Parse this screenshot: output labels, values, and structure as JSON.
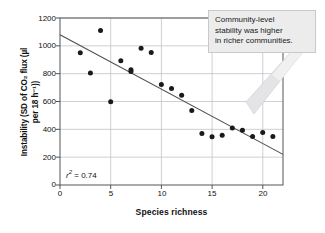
{
  "chart_data": {
    "type": "scatter",
    "title": "",
    "xlabel": "Species richness",
    "ylabel": "Instability (SD of CO2 flux (µl per 18 h−1))",
    "ylabel_line1": "Instability (SD of CO₂ flux (µl",
    "ylabel_line2": "per 18 h⁻¹))",
    "xlim": [
      0,
      22
    ],
    "ylim": [
      0,
      1200
    ],
    "xticks": [
      0,
      5,
      10,
      15,
      20
    ],
    "yticks": [
      0,
      200,
      400,
      600,
      800,
      1000,
      1200
    ],
    "xtick_labels": [
      "0",
      "5",
      "10",
      "15",
      "20"
    ],
    "ytick_labels": [
      "0",
      "200",
      "400",
      "600",
      "800",
      "1000",
      "1200"
    ],
    "grid": true,
    "legend": "none",
    "x": [
      2,
      3,
      4,
      5,
      6,
      7,
      7,
      8,
      9,
      10,
      11,
      12,
      13,
      14,
      15,
      16,
      17,
      18,
      19,
      20,
      21
    ],
    "y": [
      950,
      805,
      1110,
      598,
      893,
      828,
      816,
      983,
      952,
      723,
      694,
      645,
      536,
      370,
      346,
      358,
      410,
      393,
      348,
      377,
      348
    ],
    "series": [
      {
        "name": "Observations",
        "marker": "filled-circle",
        "color": "#1a1a1a",
        "points": [
          {
            "x": 2,
            "y": 950
          },
          {
            "x": 3,
            "y": 805
          },
          {
            "x": 4,
            "y": 1110
          },
          {
            "x": 5,
            "y": 598
          },
          {
            "x": 6,
            "y": 893
          },
          {
            "x": 7,
            "y": 828
          },
          {
            "x": 7,
            "y": 816
          },
          {
            "x": 8,
            "y": 983
          },
          {
            "x": 9,
            "y": 952
          },
          {
            "x": 10,
            "y": 723
          },
          {
            "x": 11,
            "y": 694
          },
          {
            "x": 12,
            "y": 645
          },
          {
            "x": 13,
            "y": 536
          },
          {
            "x": 14,
            "y": 370
          },
          {
            "x": 15,
            "y": 346
          },
          {
            "x": 16,
            "y": 358
          },
          {
            "x": 17,
            "y": 410
          },
          {
            "x": 18,
            "y": 393
          },
          {
            "x": 19,
            "y": 348
          },
          {
            "x": 20,
            "y": 377
          },
          {
            "x": 21,
            "y": 348
          }
        ]
      }
    ],
    "trendline": {
      "type": "linear-regression",
      "color": "#4d4d4d",
      "x_start": 0,
      "y_start": 1080,
      "x_end": 22,
      "y_end": 220
    },
    "annotations": [
      {
        "name": "r-squared",
        "text": "r2 = 0.74",
        "symbol": "r",
        "superscript": "2",
        "equals": " = 0.74",
        "x": 1,
        "y": 110
      }
    ]
  },
  "callout": {
    "line1": "Community-level",
    "line2": "stability was higher",
    "line3": "in richer communities.",
    "text": "Community-level stability was higher in richer communities.",
    "background": "#ececed",
    "border": "#c9c9cb"
  },
  "colors": {
    "marker": "#1a1a1a",
    "trendline": "#4d4d4d",
    "grid": "#b9bcc4",
    "axis": "#555555",
    "text": "#111111"
  }
}
